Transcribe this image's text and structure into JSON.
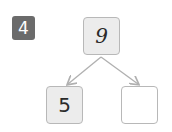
{
  "problem": {
    "number": "4",
    "badge_color": "#6b6b6b"
  },
  "number_bond": {
    "whole": "9",
    "parts": [
      "5",
      ""
    ]
  },
  "colors": {
    "box_border": "#b8b8b8",
    "filled_box": "#ececec",
    "arrow": "#b0b0b0"
  }
}
